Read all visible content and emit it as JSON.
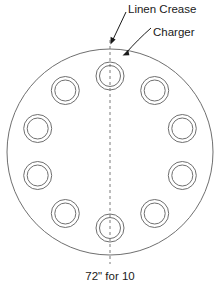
{
  "diagram": {
    "caption": "72\" for 10",
    "annotations": [
      {
        "id": "linen-crease",
        "label": "Linen Crease"
      },
      {
        "id": "charger",
        "label": "Charger"
      }
    ],
    "table": {
      "shape": "circle",
      "center_x": 110,
      "center_y": 152,
      "radius": 103,
      "stroke": "#6f6f6f"
    },
    "chargers": {
      "count": 10,
      "angle_step_deg": 36,
      "placement_radius": 76,
      "outer_radius": 14,
      "inner_radius": 10.5,
      "start_angle_deg": -90,
      "positions": [
        {
          "index": 1,
          "angle_deg": -90,
          "cx": 110,
          "cy": 76
        },
        {
          "index": 2,
          "angle_deg": -54,
          "cx": 154.7,
          "cy": 90.5
        },
        {
          "index": 3,
          "angle_deg": -18,
          "cx": 182.3,
          "cy": 128.5
        },
        {
          "index": 4,
          "angle_deg": 18,
          "cx": 182.3,
          "cy": 175.5
        },
        {
          "index": 5,
          "angle_deg": 54,
          "cx": 154.7,
          "cy": 213.5
        },
        {
          "index": 6,
          "angle_deg": 90,
          "cx": 110,
          "cy": 228
        },
        {
          "index": 7,
          "angle_deg": 126,
          "cx": 65.3,
          "cy": 213.5
        },
        {
          "index": 8,
          "angle_deg": 162,
          "cx": 37.7,
          "cy": 175.5
        },
        {
          "index": 9,
          "angle_deg": 198,
          "cx": 37.7,
          "cy": 128.5
        },
        {
          "index": 10,
          "angle_deg": 234,
          "cx": 65.3,
          "cy": 90.5
        }
      ]
    },
    "crease": {
      "orientation": "vertical",
      "style": "dashed",
      "x": 110,
      "y_top": 40,
      "y_bottom": 264
    },
    "colors": {
      "line": "#6f6f6f",
      "text": "#1a1a1a",
      "dash": "#7a7a7a",
      "background": "#ffffff"
    }
  }
}
